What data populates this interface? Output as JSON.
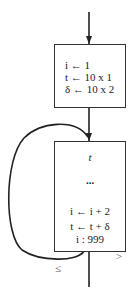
{
  "diagram": {
    "init_box": {
      "lines": [
        "i ← 1",
        "t ← 10 x 1",
        "δ ← 10 x 2"
      ]
    },
    "loop_box": {
      "top": "t",
      "ellipsis": "...",
      "lines": [
        "i ← i + 2",
        "t ← t + δ",
        "i :  999"
      ]
    },
    "branches": {
      "loop_back": "≤",
      "exit": ">"
    },
    "colors": {
      "stroke": "#222222",
      "box_border": "#333333"
    }
  }
}
